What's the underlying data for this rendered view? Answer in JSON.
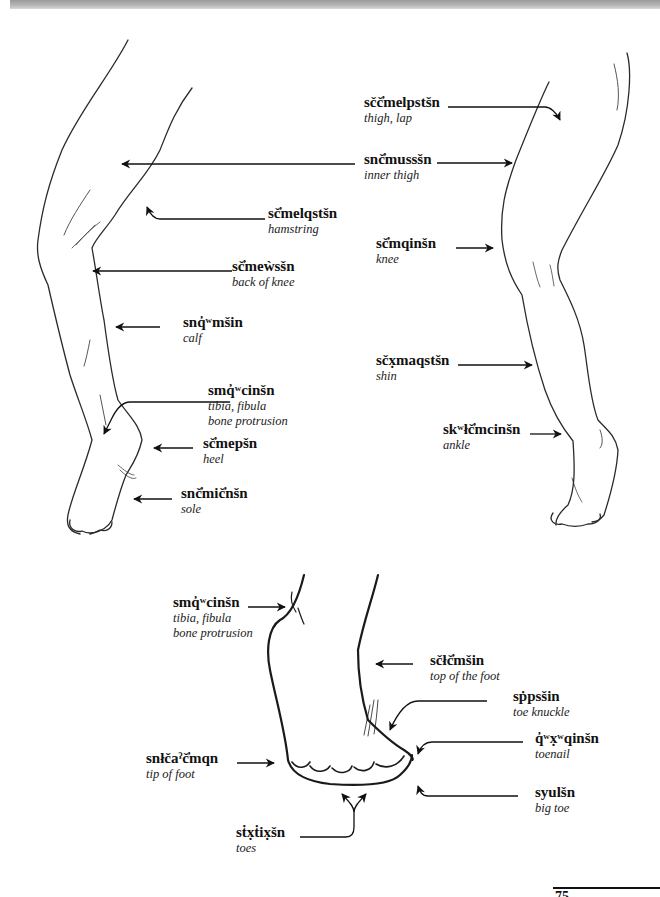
{
  "header": {
    "bar": "decorative-gradient-bar"
  },
  "diagrams": [
    {
      "name": "leg-back-view",
      "labels": [
        {
          "id": "hamstring",
          "term": "sč̓melqstšn",
          "gloss": "hamstring"
        },
        {
          "id": "back-of-knee",
          "term": "sč̓meẁsšn",
          "gloss": "back of knee"
        },
        {
          "id": "calf",
          "term": "snq̓ʷmšin",
          "gloss": "calf"
        },
        {
          "id": "tibia-fibula",
          "term": "smq̓ʷcinšn",
          "gloss": "tibia, fibula",
          "gloss2": "bone protrusion"
        },
        {
          "id": "heel",
          "term": "sč̓mepšn",
          "gloss": "heel"
        },
        {
          "id": "sole",
          "term": "snč̓mič̓nšn",
          "gloss": "sole"
        }
      ]
    },
    {
      "name": "leg-front-view",
      "labels": [
        {
          "id": "thigh",
          "term": "sčč̓melpstšn",
          "gloss": "thigh, lap"
        },
        {
          "id": "inner-thigh",
          "term": "snč̓mussšn",
          "gloss": "inner thigh"
        },
        {
          "id": "knee",
          "term": "sč̓mqinšn",
          "gloss": "knee"
        },
        {
          "id": "shin",
          "term": "sčx̣maqstšn",
          "gloss": "shin"
        },
        {
          "id": "ankle",
          "term": "skʷłč̓mcinšn",
          "gloss": "ankle"
        }
      ]
    },
    {
      "name": "foot-view",
      "labels": [
        {
          "id": "foot-tibia-fibula",
          "term": "smq̓ʷcinšn",
          "gloss": "tibia, fibula",
          "gloss2": "bone protrusion"
        },
        {
          "id": "top-of-foot",
          "term": "sčłč̓mšin",
          "gloss": "top of the foot"
        },
        {
          "id": "toe-knuckle",
          "term": "sṗpsšin",
          "gloss": "toe knuckle"
        },
        {
          "id": "toenail",
          "term": "q̓ʷx̣ʷqinšn",
          "gloss": "toenail"
        },
        {
          "id": "tip-of-foot",
          "term": "snłčaˀč̓mqn",
          "gloss": "tip of foot"
        },
        {
          "id": "big-toe",
          "term": "syulšn",
          "gloss": "big toe"
        },
        {
          "id": "toes",
          "term": "sṫx̣ṫix̣šn",
          "gloss": "toes"
        }
      ]
    }
  ],
  "footer": {
    "page_number": "75"
  },
  "colors": {
    "ink": "#111111",
    "sketch": "#2a2a2a",
    "background": "#ffffff"
  }
}
